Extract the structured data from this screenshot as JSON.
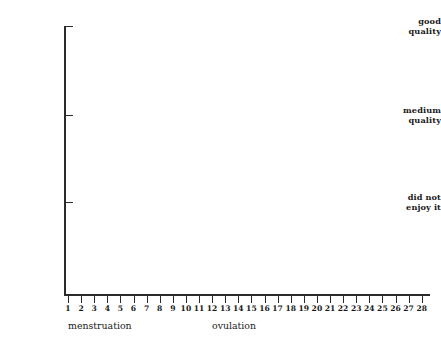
{
  "chart_data": {
    "type": "line",
    "title": "",
    "subtitle": "",
    "xlabel": "",
    "ylabel": "",
    "grid": false,
    "legend": null,
    "series": [],
    "x": [
      1,
      2,
      3,
      4,
      5,
      6,
      7,
      8,
      9,
      10,
      11,
      12,
      13,
      14,
      15,
      16,
      17,
      18,
      19,
      20,
      21,
      22,
      23,
      24,
      25,
      26,
      27,
      28
    ],
    "x_tick_labels": [
      "1",
      "2",
      "3",
      "4",
      "5",
      "6",
      "7",
      "8",
      "9",
      "10",
      "11",
      "12",
      "13",
      "14",
      "15",
      "16",
      "17",
      "18",
      "19",
      "20",
      "21",
      "22",
      "23",
      "24",
      "25",
      "26",
      "27",
      "28"
    ],
    "y_tick_labels": [
      {
        "line1": "good",
        "line2": "quality",
        "value": 3
      },
      {
        "line1": "medium",
        "line2": "quality",
        "value": 2
      },
      {
        "line1": "did not",
        "line2": "enjoy it",
        "value": 1
      }
    ],
    "x_period_labels": [
      {
        "text": "menstruation",
        "near_day": 1
      },
      {
        "text": "ovulation",
        "near_day": 12
      }
    ],
    "axis_color": "#2b2b2b",
    "background_color": "#ffffff",
    "text_color": "#1a1a1a",
    "note": "empty plot area - no data points drawn"
  },
  "axis": {
    "y_ticks": [
      {
        "label_line1": "good",
        "label_line2": "quality"
      },
      {
        "label_line1": "medium",
        "label_line2": "quality"
      },
      {
        "label_line1": "did not",
        "label_line2": "enjoy it"
      }
    ]
  },
  "footer": {
    "menstruation": "menstruation",
    "ovulation": "ovulation"
  }
}
